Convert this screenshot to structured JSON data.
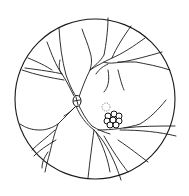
{
  "figure": {
    "type": "fundus-line-drawing",
    "colors": {
      "line": "#1a1a1a",
      "background": "#ffffff"
    },
    "fundus_circle": {
      "cx": 95,
      "cy": 99,
      "r": 80
    },
    "optic_disc": {
      "cx": 77,
      "cy": 101,
      "rx": 4,
      "ry": 5.5
    },
    "lesion_cluster": {
      "cx": 114,
      "cy": 119,
      "count": 8
    },
    "faint_lesion": {
      "cx": 106,
      "cy": 107,
      "r": 4
    }
  }
}
